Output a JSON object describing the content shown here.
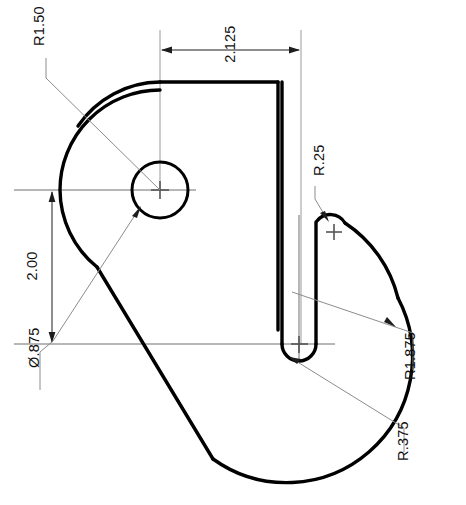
{
  "drawing": {
    "title": "Cam plate profile drawing",
    "units_note": "",
    "background_color": "#ffffff",
    "line_color": "#000000",
    "dimension_color": "#1d1d1d",
    "leader_color": "#8c8c8c"
  },
  "dimensions": [
    {
      "id": "r150",
      "label": "R1.50",
      "type": "radius",
      "value": 1.5,
      "text_x": 40,
      "text_y": 46,
      "rotation": -90,
      "target": "outer-left-arc"
    },
    {
      "id": "w2125",
      "label": "2.125",
      "type": "linear-horizontal",
      "value": 2.125,
      "text_x": 231,
      "text_y": 44,
      "rotation": -90,
      "target": "top-edge-width"
    },
    {
      "id": "r25",
      "label": "R.25",
      "type": "radius",
      "value": 0.25,
      "text_x": 320,
      "text_y": 176,
      "rotation": -90,
      "target": "slot-top-fillet"
    },
    {
      "id": "h200",
      "label": "2.00",
      "type": "linear-vertical",
      "value": 2.0,
      "text_x": 33,
      "text_y": 266,
      "rotation": -90,
      "target": "center-to-base"
    },
    {
      "id": "dia875",
      "label": "Ø.875",
      "type": "diameter",
      "value": 0.875,
      "text_x": 35,
      "text_y": 368,
      "rotation": -90,
      "target": "center-hole"
    },
    {
      "id": "r1875",
      "label": "R1.875",
      "type": "radius",
      "value": 1.875,
      "text_x": 411,
      "text_y": 380,
      "rotation": -90,
      "target": "outer-right-arc"
    },
    {
      "id": "r375",
      "label": "R.375",
      "type": "radius",
      "value": 0.375,
      "text_x": 404,
      "text_y": 461,
      "rotation": -90,
      "target": "slot-end-round"
    }
  ],
  "geometry": {
    "center_hole": {
      "cx": 160,
      "cy": 190,
      "r": 28
    },
    "profile_left_arc": {
      "cx": 160,
      "cy": 190,
      "r": 100
    },
    "profile_right_arc": {
      "cx": 299,
      "cy": 344,
      "r": 126
    },
    "slot_end": {
      "cx": 299,
      "cy": 344,
      "r": 17
    },
    "slot_fillet": {
      "cx": 334,
      "cy": 232,
      "r": 17
    },
    "top_edge_y": 82,
    "top_edge_x_right": 278,
    "baseline_y": 344
  }
}
